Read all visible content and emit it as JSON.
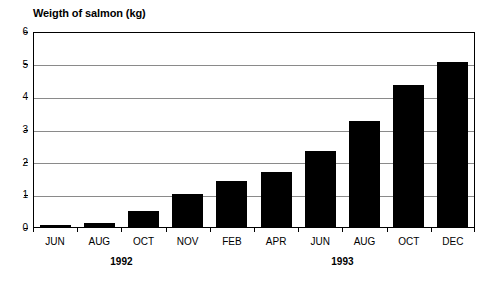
{
  "chart_data": {
    "type": "bar",
    "title": "Weigth of salmon (kg)",
    "xlabel": "",
    "ylabel": "",
    "ylim": [
      0,
      6
    ],
    "yticks": [
      0,
      1,
      2,
      3,
      4,
      5,
      6
    ],
    "ytick_labels": [
      "0",
      "1",
      "2",
      "3",
      "4",
      "5",
      "6"
    ],
    "grid": true,
    "legend": null,
    "bar_color": "#000000",
    "grid_color": "#8a8a8a",
    "axis_color": "#000000",
    "categories": [
      "JUN",
      "AUG",
      "OCT",
      "NOV",
      "FEB",
      "APR",
      "JUN",
      "AUG",
      "OCT",
      "DEC"
    ],
    "values": [
      0.08,
      0.16,
      0.52,
      1.05,
      1.44,
      1.73,
      2.36,
      3.27,
      4.37,
      5.08
    ],
    "groups": [
      {
        "label": "1992",
        "categories": [
          "JUN",
          "AUG",
          "OCT",
          "NOV"
        ]
      },
      {
        "label": "1993",
        "categories": [
          "FEB",
          "APR",
          "JUN",
          "AUG",
          "OCT",
          "DEC"
        ]
      }
    ],
    "group_labels": [
      "1992",
      "1993"
    ]
  }
}
